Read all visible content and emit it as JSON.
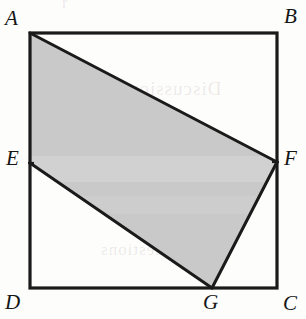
{
  "figure": {
    "caption": "",
    "type": "plane-geometry-diagram",
    "canvas": {
      "width": 306,
      "height": 319
    },
    "colors": {
      "background": "#fdfdfc",
      "stroke": "#1a1a1a",
      "shaded_fill": "#c9c9c9",
      "label_text": "#151515"
    },
    "stroke_widths": {
      "square": 3.2,
      "polygon": 3.0
    },
    "square": {
      "name": "ABCD",
      "vertices": [
        {
          "id": "A",
          "x": 30,
          "y": 33
        },
        {
          "id": "B",
          "x": 277,
          "y": 33
        },
        {
          "id": "C",
          "x": 277,
          "y": 288
        },
        {
          "id": "D",
          "x": 30,
          "y": 288
        }
      ]
    },
    "points_on_sides": [
      {
        "id": "E",
        "x": 30,
        "y": 163,
        "on_side": "AD"
      },
      {
        "id": "F",
        "x": 277,
        "y": 162,
        "on_side": "BC"
      },
      {
        "id": "G",
        "x": 212,
        "y": 288,
        "on_side": "DC"
      }
    ],
    "shaded_polygon": {
      "name": "AFGE",
      "path": "M30,33 L277,162 L212,288 L30,163 Z",
      "vertex_order": [
        "A",
        "F",
        "G",
        "E"
      ]
    },
    "segments": [
      {
        "from": "A",
        "to": "F"
      },
      {
        "from": "F",
        "to": "G"
      },
      {
        "from": "G",
        "to": "E"
      },
      {
        "from": "E",
        "to": "A"
      }
    ],
    "labels": [
      {
        "id": "A",
        "text": "A",
        "x": 5,
        "y": 8
      },
      {
        "id": "B",
        "text": "B",
        "x": 284,
        "y": 6
      },
      {
        "id": "E",
        "text": "E",
        "x": 6,
        "y": 148
      },
      {
        "id": "F",
        "text": "F",
        "x": 284,
        "y": 148
      },
      {
        "id": "D",
        "text": "D",
        "x": 5,
        "y": 292
      },
      {
        "id": "G",
        "text": "G",
        "x": 203,
        "y": 292
      },
      {
        "id": "C",
        "text": "C",
        "x": 283,
        "y": 293
      }
    ],
    "ghost_marks": [
      {
        "text": "Discussion",
        "x": 128,
        "y": 78,
        "size": 19
      },
      {
        "text": "questions",
        "x": 100,
        "y": 240,
        "size": 17
      },
      {
        "text": "r",
        "x": 62,
        "y": -6,
        "size": 16
      }
    ]
  }
}
